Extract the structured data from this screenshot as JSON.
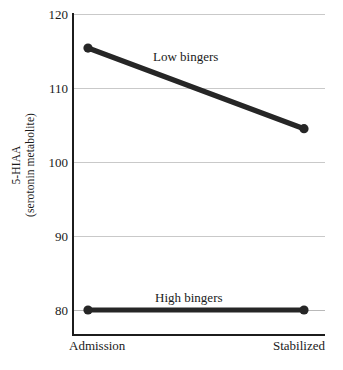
{
  "chart_data": {
    "type": "line",
    "title": "",
    "xlabel": "",
    "ylabel_line1": "5-HIAA",
    "ylabel_line2": "(serotonin metabolite)",
    "categories": [
      "Admission",
      "Stabilized"
    ],
    "ylim": [
      76,
      120
    ],
    "yticks": [
      120,
      110,
      100,
      90,
      80
    ],
    "ytick_labels": [
      "120",
      "110",
      "100",
      "90",
      "80"
    ],
    "grid": true,
    "grid_axis": "y",
    "legend": "inline-labels",
    "series": [
      {
        "name": "Low bingers",
        "values": [
          115.4,
          104.5
        ],
        "color": "#262626",
        "marker": "circle",
        "label_position": "above-line-middle"
      },
      {
        "name": "High bingers",
        "values": [
          80.0,
          80.0
        ],
        "color": "#262626",
        "marker": "circle",
        "label_position": "above-line-middle"
      }
    ]
  },
  "axes": {
    "y_tick_labels": [
      "120",
      "110",
      "100",
      "90",
      "80"
    ],
    "x_tick_labels": [
      "Admission",
      "Stabilized"
    ]
  },
  "labels": {
    "low_bingers": "Low bingers",
    "high_bingers": "High bingers"
  },
  "colors": {
    "series": "#262626",
    "gridline": "#c9c9c9",
    "axis": "#1c1c1c",
    "text": "#1a1a1a",
    "background": "#ffffff"
  },
  "caption": {
    "sliver_text": ""
  }
}
